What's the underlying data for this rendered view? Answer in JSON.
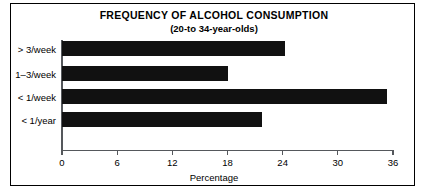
{
  "chart_data": {
    "type": "bar",
    "orientation": "horizontal",
    "title": "FREQUENCY OF ALCOHOL CONSUMPTION",
    "subtitle": "(20-to 34-year-olds)",
    "xlabel": "Percentage",
    "ylabel": "",
    "categories": [
      "> 3/week",
      "1–3/week",
      "< 1/week",
      "< 1/year"
    ],
    "values": [
      24.3,
      18.0,
      35.4,
      21.7
    ],
    "xlim": [
      0,
      36
    ],
    "xticks": [
      0,
      6,
      12,
      18,
      24,
      30,
      36
    ],
    "xticklabels": [
      "0",
      "6",
      "12",
      "18",
      "24",
      "30",
      "36"
    ],
    "grid": false,
    "legend": null,
    "bar_color": "#111111",
    "frame_color": "#000000",
    "axis_color": "#55585c",
    "background": "#ffffff"
  },
  "figure": {
    "width": 428,
    "height": 195
  }
}
